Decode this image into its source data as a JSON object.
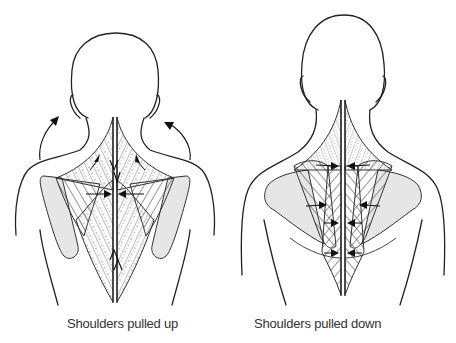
{
  "diagram": {
    "type": "anatomical-illustration",
    "figures": [
      {
        "id": "left",
        "caption": "Shoulders pulled up",
        "arrows": "upward arrows at shoulders; fibers converge toward spine"
      },
      {
        "id": "right",
        "caption": "Shoulders pulled down",
        "arrows": "horizontal arrows pointing inward toward spine"
      }
    ],
    "colors": {
      "line": "#222222",
      "shaded_region": "#e6e6e6",
      "background": "#ffffff"
    }
  }
}
